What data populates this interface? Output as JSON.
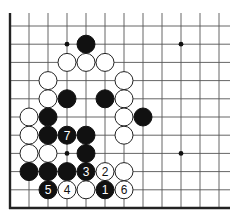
{
  "board": {
    "title": "Go board fragment (lower-left corner)",
    "grid": {
      "origin_x": 10,
      "origin_y": 208,
      "spacing_x": 19,
      "spacing_y": 18.2,
      "cols": 12,
      "rows": 11,
      "line_extent_right": 230,
      "line_extent_top": 13
    },
    "star_points": [
      {
        "col": 3,
        "row": 9
      },
      {
        "col": 9,
        "row": 9
      },
      {
        "col": 3,
        "row": 3
      },
      {
        "col": 9,
        "row": 3
      }
    ],
    "stones": [
      {
        "color": "black",
        "col": 4,
        "row": 9,
        "label": ""
      },
      {
        "color": "white",
        "col": 3,
        "row": 8,
        "label": ""
      },
      {
        "color": "white",
        "col": 4,
        "row": 8,
        "label": ""
      },
      {
        "color": "white",
        "col": 5,
        "row": 8,
        "label": ""
      },
      {
        "color": "white",
        "col": 2,
        "row": 7,
        "label": ""
      },
      {
        "color": "white",
        "col": 6,
        "row": 7,
        "label": ""
      },
      {
        "color": "white",
        "col": 2,
        "row": 6,
        "label": ""
      },
      {
        "color": "black",
        "col": 3,
        "row": 6,
        "label": ""
      },
      {
        "color": "black",
        "col": 5,
        "row": 6,
        "label": ""
      },
      {
        "color": "white",
        "col": 6,
        "row": 6,
        "label": ""
      },
      {
        "color": "white",
        "col": 1,
        "row": 5,
        "label": ""
      },
      {
        "color": "black",
        "col": 2,
        "row": 5,
        "label": ""
      },
      {
        "color": "white",
        "col": 6,
        "row": 5,
        "label": ""
      },
      {
        "color": "black",
        "col": 7,
        "row": 5,
        "label": ""
      },
      {
        "color": "white",
        "col": 1,
        "row": 4,
        "label": ""
      },
      {
        "color": "black",
        "col": 2,
        "row": 4,
        "label": ""
      },
      {
        "color": "black",
        "col": 3,
        "row": 4,
        "label": "7"
      },
      {
        "color": "black",
        "col": 4,
        "row": 4,
        "label": ""
      },
      {
        "color": "white",
        "col": 6,
        "row": 4,
        "label": ""
      },
      {
        "color": "white",
        "col": 1,
        "row": 3,
        "label": ""
      },
      {
        "color": "white",
        "col": 2,
        "row": 3,
        "label": ""
      },
      {
        "color": "black",
        "col": 4,
        "row": 3,
        "label": ""
      },
      {
        "color": "black",
        "col": 1,
        "row": 2,
        "label": ""
      },
      {
        "color": "black",
        "col": 2,
        "row": 2,
        "label": ""
      },
      {
        "color": "black",
        "col": 3,
        "row": 2,
        "label": ""
      },
      {
        "color": "black",
        "col": 4,
        "row": 2,
        "label": "3"
      },
      {
        "color": "white",
        "col": 5,
        "row": 2,
        "label": "2"
      },
      {
        "color": "white",
        "col": 6,
        "row": 2,
        "label": ""
      },
      {
        "color": "black",
        "col": 2,
        "row": 1,
        "label": "5"
      },
      {
        "color": "white",
        "col": 3,
        "row": 1,
        "label": "4"
      },
      {
        "color": "white",
        "col": 4,
        "row": 1,
        "label": ""
      },
      {
        "color": "black",
        "col": 5,
        "row": 1,
        "label": "1"
      },
      {
        "color": "white",
        "col": 6,
        "row": 1,
        "label": "6"
      }
    ],
    "stone_radius": 9,
    "colors": {
      "black": "#111111",
      "white": "#ffffff",
      "line": "#555555",
      "edge": "#222222"
    }
  }
}
